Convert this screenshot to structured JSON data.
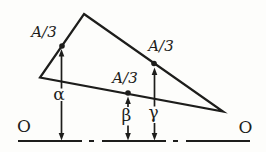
{
  "figure": {
    "labels": {
      "left_midpoint": "A/3",
      "middle_midpoint": "A/3",
      "right_midpoint": "A/3",
      "alpha": "α",
      "beta": "β",
      "gamma": "γ",
      "datum_left": "O",
      "datum_right": "O"
    },
    "colors": {
      "ink": "#1d1d1b",
      "paper": "#fdfdfb"
    }
  }
}
